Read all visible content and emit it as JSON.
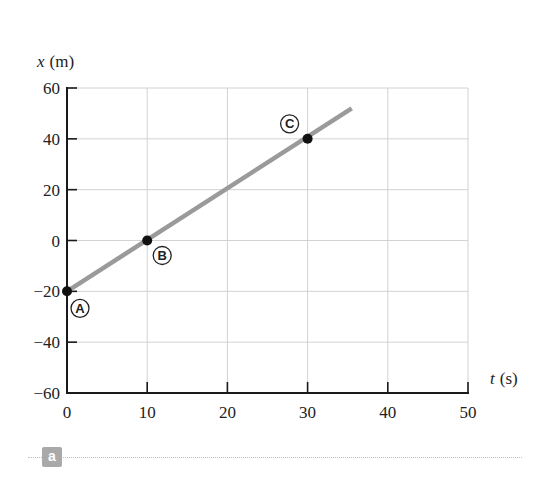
{
  "chart_data": {
    "type": "line",
    "title": "",
    "xlabel": "t (s)",
    "ylabel": "x (m)",
    "xlabel_var": "t",
    "xlabel_unit": "(s)",
    "ylabel_var": "x",
    "ylabel_unit": "(m)",
    "xlim": [
      0,
      50
    ],
    "ylim": [
      -60,
      60
    ],
    "x_ticks": [
      0,
      10,
      20,
      30,
      40,
      50
    ],
    "y_ticks": [
      60,
      40,
      20,
      0,
      -20,
      -40,
      -60
    ],
    "x_tick_labels": [
      "0",
      "10",
      "20",
      "30",
      "40",
      "50"
    ],
    "y_tick_labels": [
      "60",
      "40",
      "20",
      "0",
      "−20",
      "−40",
      "−60"
    ],
    "grid": true,
    "series": [
      {
        "name": "position",
        "x": [
          0,
          35.5
        ],
        "y": [
          -20,
          52
        ],
        "color": "#9a9a9a"
      }
    ],
    "points": [
      {
        "label": "A",
        "t": 0,
        "x": -20
      },
      {
        "label": "B",
        "t": 10,
        "x": 0
      },
      {
        "label": "C",
        "t": 30,
        "x": 40
      }
    ],
    "legend": null
  },
  "figure": {
    "panel_label": "a",
    "colors": {
      "line": "#9a9a9a",
      "grid": "#d2d2d2",
      "axis": "#1a1a1a",
      "badge": "#a9a9a9"
    }
  }
}
